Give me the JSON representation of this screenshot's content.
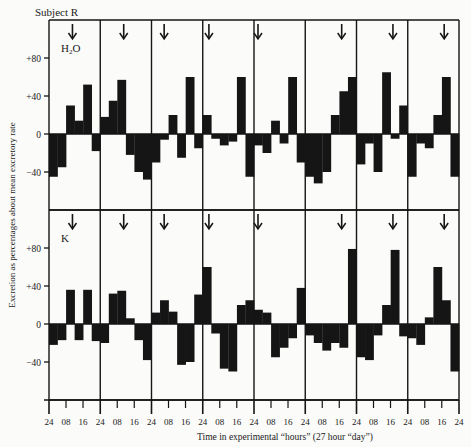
{
  "chart_data": {
    "type": "bar",
    "title": "Subject R",
    "xlabel": "Time in experimental “hours” (27 hour “day”)",
    "ylabel": "Excretion as percentages about mean excretory rate",
    "ylim": [
      -60,
      100
    ],
    "yticks": [
      -40,
      0,
      40,
      80
    ],
    "ytick_labels": [
      "−40",
      "0",
      "+40",
      "+80"
    ],
    "xtick_labels": [
      "24",
      "08",
      "16",
      "24",
      "08",
      "16",
      "24",
      "08",
      "16",
      "24",
      "08",
      "16",
      "24",
      "08",
      "16",
      "24",
      "08",
      "16",
      "24",
      "08",
      "16",
      "24",
      "08",
      "16",
      "24"
    ],
    "days": 8,
    "bins_per_day": 6,
    "marker": "down-arrow at top of each day",
    "series": [
      {
        "name": "H₂O",
        "label_main": "H",
        "label_sub": "2",
        "label_tail": "O",
        "values": [
          -45,
          -35,
          30,
          14,
          52,
          -18,
          18,
          35,
          57,
          -22,
          -40,
          -48,
          -30,
          -6,
          20,
          -25,
          60,
          -15,
          20,
          -5,
          -12,
          -8,
          60,
          -45,
          -12,
          -20,
          14,
          -10,
          60,
          -30,
          -45,
          -52,
          -40,
          20,
          45,
          60,
          -32,
          -10,
          -40,
          65,
          -5,
          30,
          -45,
          -10,
          -15,
          20,
          60,
          -45
        ]
      },
      {
        "name": "K",
        "label_main": "K",
        "label_sub": "",
        "label_tail": "",
        "values": [
          -22,
          -17,
          36,
          -17,
          36,
          -18,
          -20,
          32,
          35,
          6,
          -17,
          -38,
          12,
          25,
          13,
          -43,
          -40,
          31,
          60,
          -10,
          -47,
          -50,
          20,
          25,
          15,
          12,
          -35,
          -25,
          -15,
          38,
          -12,
          -20,
          -28,
          -20,
          -25,
          79,
          -35,
          -38,
          -12,
          20,
          78,
          -13,
          -15,
          -22,
          7,
          60,
          25,
          -50
        ]
      }
    ],
    "arrow_positions_per_day": [
      [
        0.45,
        0.45,
        0.2,
        0.05,
        0.0,
        0.75,
        0.75,
        0.75
      ],
      [
        0.45,
        0.45,
        0.2,
        0.05,
        0.0,
        0.75,
        0.75,
        0.75
      ]
    ],
    "grid": false,
    "legend": "none"
  }
}
